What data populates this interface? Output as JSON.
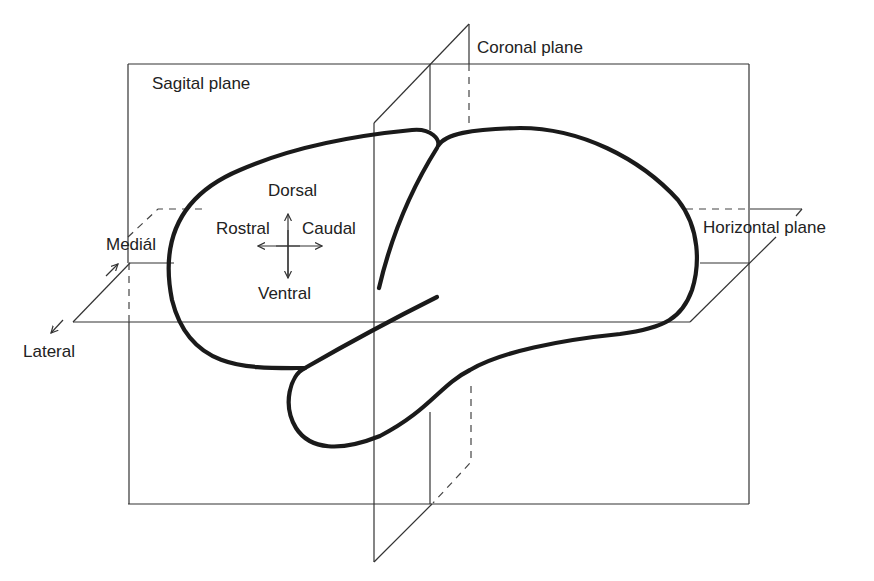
{
  "diagram": {
    "planes": {
      "sagittal": "Sagital plane",
      "coronal": "Coronal plane",
      "horizontal": "Horizontal plane"
    },
    "directions": {
      "dorsal": "Dorsal",
      "ventral": "Ventral",
      "rostral": "Rostral",
      "caudal": "Caudal",
      "medial": "Mediál",
      "lateral": "Lateral"
    },
    "colors": {
      "background": "#ffffff",
      "line": "#333333",
      "brain_outline": "#1a1a1a",
      "text": "#222222"
    }
  }
}
